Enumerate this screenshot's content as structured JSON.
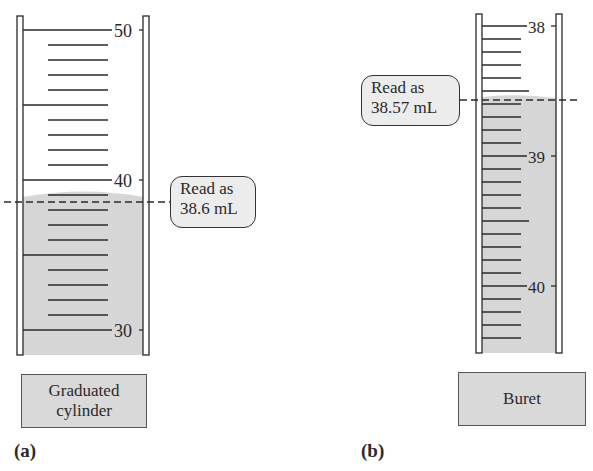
{
  "figure": {
    "panel_a": {
      "label": "(a)",
      "instrument": "Graduated cylinder",
      "instrument_line1": "Graduated",
      "instrument_line2": "cylinder",
      "scale_labels": [
        "50",
        "40",
        "30"
      ],
      "scale_range_ml": [
        30,
        50
      ],
      "minor_tick_ml": 1,
      "major_tick_ml": 5,
      "liquid_level_ml": 38.6,
      "callout_line1": "Read as",
      "callout_line2": "38.6 mL"
    },
    "panel_b": {
      "label": "(b)",
      "instrument": "Buret",
      "scale_labels": [
        "38",
        "39",
        "40"
      ],
      "scale_range_ml": [
        38,
        40.5
      ],
      "minor_tick_ml": 0.1,
      "liquid_level_ml": 38.57,
      "callout_line1": "Read as",
      "callout_line2": "38.57 mL"
    },
    "colors": {
      "liquid": "#d6d6d6",
      "label_box": "#d9d9d9",
      "callout_bg": "#ececec",
      "lines": "#2a2a2a"
    }
  }
}
